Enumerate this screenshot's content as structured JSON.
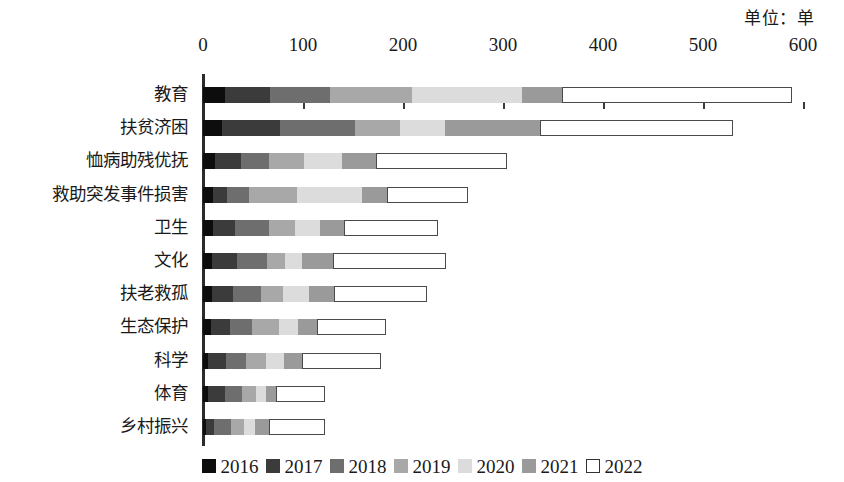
{
  "unit_note": "单位：单",
  "chart_data": {
    "type": "bar",
    "orientation": "horizontal",
    "stacked": true,
    "title": "",
    "subtitle": "",
    "xlabel": "",
    "ylabel": "",
    "unit": "单位：单",
    "xlim": [
      0,
      600
    ],
    "grid": false,
    "legend_position": "bottom",
    "tick_labels": [
      "0",
      "100",
      "200",
      "300",
      "400",
      "500",
      "600"
    ],
    "tick_values": [
      0,
      100,
      200,
      300,
      400,
      500,
      600
    ],
    "categories": [
      "教育",
      "扶贫济困",
      "恤病助残优抚",
      "救助突发事件损害",
      "卫生",
      "文化",
      "扶老救孤",
      "生态保护",
      "科学",
      "体育",
      "乡村振兴"
    ],
    "series": [
      {
        "name": "2016",
        "color": "#0d0d0d",
        "values": [
          22,
          19,
          12,
          10,
          10,
          9,
          9,
          8,
          5,
          5,
          3
        ]
      },
      {
        "name": "2017",
        "color": "#3b3b3b",
        "values": [
          45,
          58,
          26,
          14,
          22,
          25,
          21,
          19,
          18,
          17,
          8
        ]
      },
      {
        "name": "2018",
        "color": "#6e6e6e",
        "values": [
          60,
          75,
          28,
          22,
          34,
          30,
          28,
          22,
          20,
          17,
          17
        ]
      },
      {
        "name": "2019",
        "color": "#a8a8a8",
        "values": [
          82,
          45,
          35,
          48,
          26,
          18,
          22,
          27,
          20,
          14,
          13
        ]
      },
      {
        "name": "2020",
        "color": "#dcdcdc",
        "values": [
          110,
          45,
          38,
          65,
          25,
          17,
          26,
          19,
          18,
          10,
          11
        ]
      },
      {
        "name": "2021",
        "color": "#9a9a9a",
        "values": [
          40,
          95,
          34,
          25,
          24,
          31,
          25,
          19,
          18,
          10,
          14
        ]
      },
      {
        "name": "2022",
        "color": "#ffffff",
        "values": [
          230,
          193,
          131,
          81,
          94,
          113,
          93,
          69,
          79,
          49,
          56
        ]
      }
    ],
    "totals": [
      589,
      530,
      304,
      265,
      235,
      243,
      224,
      183,
      178,
      122,
      122
    ]
  },
  "legend": {
    "items": [
      {
        "label": "2016",
        "color": "#0d0d0d",
        "hollow": false
      },
      {
        "label": "2017",
        "color": "#3b3b3b",
        "hollow": false
      },
      {
        "label": "2018",
        "color": "#6e6e6e",
        "hollow": false
      },
      {
        "label": "2019",
        "color": "#a8a8a8",
        "hollow": false
      },
      {
        "label": "2020",
        "color": "#dcdcdc",
        "hollow": false
      },
      {
        "label": "2021",
        "color": "#9a9a9a",
        "hollow": false
      },
      {
        "label": "2022",
        "color": "#ffffff",
        "hollow": true
      }
    ]
  }
}
